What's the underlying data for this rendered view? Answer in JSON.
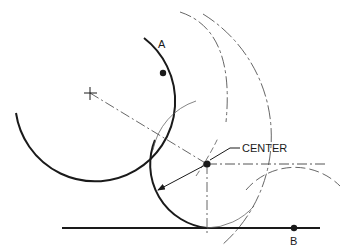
{
  "diagram": {
    "labels": {
      "point_a": "A",
      "point_b": "B",
      "center": "CENTER"
    },
    "colors": {
      "ink": "#1a1a1a",
      "construction": "#555555",
      "background": "#ffffff"
    },
    "elements": [
      {
        "type": "arc",
        "name": "given-arc",
        "center": [
          90,
          93
        ],
        "radius": 80,
        "style": "solid-heavy"
      },
      {
        "type": "line",
        "name": "given-line",
        "from": [
          62,
          228
        ],
        "to": [
          320,
          228
        ],
        "style": "solid-heavy"
      },
      {
        "type": "point",
        "name": "point-a",
        "at": [
          163,
          73
        ]
      },
      {
        "type": "point",
        "name": "point-b",
        "at": [
          294,
          228
        ]
      },
      {
        "type": "marker",
        "name": "given-arc-center",
        "at": [
          90,
          93
        ],
        "glyph": "+"
      },
      {
        "type": "point",
        "name": "tangent-arc-center",
        "at": [
          207,
          164
        ]
      },
      {
        "type": "arc",
        "name": "tangent-arc",
        "center": [
          207,
          164
        ],
        "radius": 64,
        "style": "solid-heavy"
      },
      {
        "type": "arrow",
        "name": "radius-arrow",
        "from": [
          207,
          164
        ],
        "to": [
          157,
          190
        ]
      },
      {
        "type": "line",
        "name": "center-to-center",
        "from": [
          90,
          93
        ],
        "to": [
          207,
          164
        ],
        "style": "dash-dot"
      },
      {
        "type": "line",
        "name": "horizontal-offset-line",
        "from": [
          207,
          164
        ],
        "to": [
          328,
          164
        ],
        "style": "dash-dot"
      },
      {
        "type": "line",
        "name": "vertical-construction-line",
        "from": [
          207,
          164
        ],
        "to": [
          207,
          236
        ],
        "style": "dash-dot"
      },
      {
        "type": "arc",
        "name": "construction-arc-from-given-arc",
        "center": [
          90,
          93
        ],
        "radius": 144,
        "style": "dashed"
      },
      {
        "type": "arc",
        "name": "construction-arc-upper",
        "style": "dashed"
      },
      {
        "type": "arc",
        "name": "construction-arc-right",
        "center": [
          282,
          228
        ],
        "radius": 64,
        "style": "dashed"
      }
    ]
  }
}
